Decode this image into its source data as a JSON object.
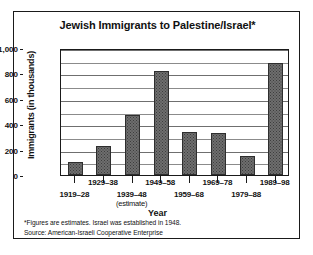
{
  "chart_data": {
    "type": "bar",
    "title": "Jewish Immigrants to Palestine/Israel*",
    "xlabel": "Year",
    "ylabel": "Immigrants (in thousands)",
    "categories": [
      "1919–28",
      "1929–38",
      "1939–48",
      "1949–58",
      "1959–68",
      "1969–78",
      "1979–88",
      "1989–98"
    ],
    "category_sublabels": [
      "",
      "",
      "(estimate)",
      "",
      "",
      "",
      "",
      ""
    ],
    "values": [
      100,
      225,
      470,
      820,
      340,
      330,
      150,
      880
    ],
    "ylim": [
      0,
      1000
    ],
    "yticks": [
      0,
      200,
      400,
      600,
      800,
      1000
    ],
    "ytick_labels": [
      "0",
      "200",
      "400",
      "600",
      "800",
      "1,000"
    ],
    "minor_gridlines": [
      100,
      300,
      500,
      700,
      900
    ],
    "grid": true,
    "legend": "none",
    "bar_color": "#6e6e6e",
    "bar_border_color": "#2e2e2e",
    "axis_color": "#1a1a1a",
    "background": "#ffffff"
  },
  "notes": {
    "footnote": "*Figures are estimates. Israel was established in 1948.",
    "source": "Source: American-Israeli Cooperative Enterprise"
  }
}
